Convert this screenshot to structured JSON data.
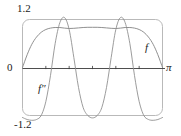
{
  "figure": {
    "kind": "math-graph",
    "background_color": "#ffffff",
    "ink_color": "#1a1a1a",
    "curve_color": "#8a8a8a",
    "frame_color": "#b5b5b5"
  },
  "labels": {
    "y_max": "1.2",
    "y_min": "-1.2",
    "zero": "0",
    "x_max": "π",
    "curve_f": "f",
    "curve_fpp": "f″"
  },
  "chart_data": {
    "type": "line",
    "title": "",
    "xlabel": "",
    "ylabel": "",
    "xlim": [
      0,
      3.14159
    ],
    "ylim": [
      -1.2,
      1.2
    ],
    "xticks": [
      0,
      3.14159
    ],
    "xticklabels": [
      "0",
      "π"
    ],
    "yticks": [
      -1.2,
      0,
      1.2
    ],
    "yticklabels": [
      "-1.2",
      "0",
      "1.2"
    ],
    "grid": false,
    "legend": "inline-annotations",
    "frame": "rounded-box",
    "annotations": [
      {
        "text": "f",
        "x": 2.65,
        "y": 0.52
      },
      {
        "text": "f″",
        "x": 0.35,
        "y": -0.35
      },
      {
        "text": "1.2",
        "x": 0.0,
        "y": 1.2
      },
      {
        "text": "-1.2",
        "x": 0.0,
        "y": -1.2
      },
      {
        "text": "0",
        "x": 0.0,
        "y": 0.0
      },
      {
        "text": "π",
        "x": 3.14159,
        "y": 0.0
      }
    ],
    "series": [
      {
        "name": "f",
        "label": "f",
        "color": "#8a8a8a",
        "x": [
          0.0,
          0.105,
          0.209,
          0.314,
          0.419,
          0.524,
          0.628,
          0.733,
          0.838,
          0.942,
          1.047,
          1.152,
          1.257,
          1.361,
          1.466,
          1.571,
          1.676,
          1.78,
          1.885,
          1.99,
          2.094,
          2.199,
          2.304,
          2.409,
          2.513,
          2.618,
          2.723,
          2.827,
          2.932,
          3.037,
          3.14159
        ],
        "y": [
          0.0,
          0.32,
          0.58,
          0.76,
          0.88,
          0.95,
          0.985,
          1.0,
          1.0,
          0.985,
          0.975,
          0.98,
          0.99,
          1.0,
          1.005,
          1.005,
          1.005,
          1.0,
          0.99,
          0.98,
          0.975,
          0.985,
          1.0,
          1.0,
          0.985,
          0.95,
          0.88,
          0.76,
          0.58,
          0.32,
          0.0
        ]
      },
      {
        "name": "f''",
        "label": "f″",
        "color": "#8a8a8a",
        "x": [
          0.0,
          0.105,
          0.209,
          0.314,
          0.419,
          0.524,
          0.628,
          0.733,
          0.838,
          0.942,
          1.047,
          1.152,
          1.257,
          1.361,
          1.466,
          1.571,
          1.676,
          1.78,
          1.885,
          1.99,
          2.094,
          2.199,
          2.304,
          2.409,
          2.513,
          2.618,
          2.723,
          2.827,
          2.932,
          3.037,
          3.14159
        ],
        "y": [
          -1.25,
          -1.3,
          -1.32,
          -1.3,
          -1.2,
          -0.85,
          -0.2,
          0.6,
          1.12,
          1.25,
          0.95,
          0.25,
          -0.5,
          -1.0,
          -1.2,
          -1.26,
          -1.2,
          -1.0,
          -0.5,
          0.25,
          0.95,
          1.25,
          1.12,
          0.6,
          -0.2,
          -0.85,
          -1.2,
          -1.3,
          -1.32,
          -1.3,
          -1.25
        ]
      }
    ]
  }
}
